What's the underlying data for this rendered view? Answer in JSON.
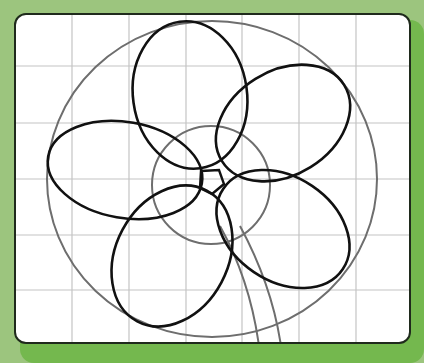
{
  "figure": {
    "title": "",
    "colors": {
      "background": "#9cc57e",
      "background_shade": "#74b84e",
      "card": "#ffffff",
      "card_border": "#1f2a1c",
      "grid": "#c4c4c4",
      "guide": "#6e6e6e",
      "petal": "#111111"
    },
    "grid": {
      "vertical_lines_x": [
        72,
        129,
        186,
        242,
        299,
        356
      ],
      "horizontal_lines_y": [
        66,
        123,
        179,
        235,
        290
      ]
    },
    "guides": {
      "outer_ellipse": {
        "cx": 212,
        "cy": 179,
        "rx": 165,
        "ry": 158
      },
      "inner_circle": {
        "cx": 211,
        "cy": 185,
        "r": 59
      },
      "stems": [
        {
          "d": "M220 226 Q250 280 259 346"
        },
        {
          "d": "M240 226 Q272 285 281 346"
        }
      ]
    },
    "petals": [
      {
        "name": "top",
        "cx": 190,
        "cy": 95,
        "rx": 57,
        "ry": 74,
        "angle": -8
      },
      {
        "name": "upper-right",
        "cx": 283,
        "cy": 123,
        "rx": 72,
        "ry": 52,
        "angle": -32
      },
      {
        "name": "left",
        "cx": 125,
        "cy": 170,
        "rx": 78,
        "ry": 48,
        "angle": 10
      },
      {
        "name": "lower-left",
        "cx": 172,
        "cy": 256,
        "rx": 56,
        "ry": 74,
        "angle": 28
      },
      {
        "name": "lower-right",
        "cx": 283,
        "cy": 229,
        "rx": 72,
        "ry": 52,
        "angle": 34
      }
    ],
    "center_pentagon": {
      "points": "201,171 219,170 224,184 212,194 200,188"
    }
  }
}
